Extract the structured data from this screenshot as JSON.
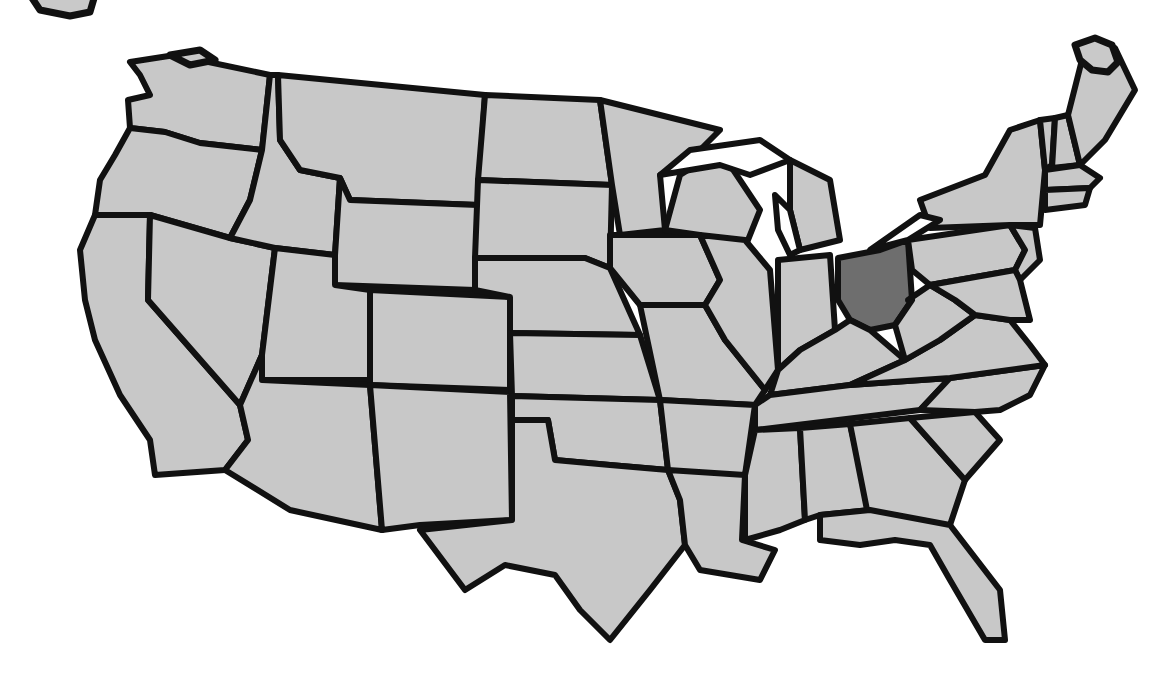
{
  "map": {
    "type": "us-states-outline",
    "colors": {
      "background": "#ffffff",
      "state_fill": "#c8c8c8",
      "highlight_fill": "#6e6e6e",
      "border": "#111111"
    },
    "highlighted_states": [
      "Ohio"
    ],
    "states": [
      {
        "name": "Washington",
        "points": "130,62 175,55 270,75 262,150 200,143 165,132 130,128 128,100 150,95 140,75"
      },
      {
        "name": "Oregon",
        "points": "130,128 165,132 200,143 262,150 250,200 230,238 150,215 95,215 100,180 115,155"
      },
      {
        "name": "California",
        "points": "95,215 150,215 148,300 240,405 248,440 225,470 155,475 150,440 120,395 95,340 85,300 80,250"
      },
      {
        "name": "Nevada",
        "points": "150,215 230,238 275,248 262,355 240,405 148,300"
      },
      {
        "name": "Idaho",
        "points": "270,75 278,75 280,140 300,170 340,178 335,255 275,248 230,238 250,200 262,150"
      },
      {
        "name": "Montana",
        "points": "278,75 485,95 478,205 350,200 340,178 300,170 280,140"
      },
      {
        "name": "Wyoming",
        "points": "350,200 478,205 475,290 335,285 335,255 340,178"
      },
      {
        "name": "Utah",
        "points": "275,248 335,255 335,285 370,290 370,380 262,380 262,355"
      },
      {
        "name": "Arizona",
        "points": "262,380 370,385 382,530 290,510 225,470 248,440 240,405 262,355"
      },
      {
        "name": "Colorado",
        "points": "370,290 510,297 510,390 370,385"
      },
      {
        "name": "New Mexico",
        "points": "370,385 510,392 512,520 420,525 382,530"
      },
      {
        "name": "North Dakota",
        "points": "485,95 600,100 612,185 478,180"
      },
      {
        "name": "South Dakota",
        "points": "478,180 612,185 610,268 585,258 475,258"
      },
      {
        "name": "Nebraska",
        "points": "475,258 585,258 610,268 640,335 510,333 510,297 475,290"
      },
      {
        "name": "Kansas",
        "points": "510,333 640,335 660,400 512,396"
      },
      {
        "name": "Oklahoma",
        "points": "512,396 660,400 668,470 610,465 555,460 548,420 512,420"
      },
      {
        "name": "Texas",
        "points": "512,420 548,420 555,460 610,465 668,470 680,500 685,545 650,590 610,640 580,610 555,575 505,565 465,590 420,530 512,520"
      },
      {
        "name": "Minnesota",
        "points": "600,100 720,130 690,160 660,175 665,230 620,235 612,185"
      },
      {
        "name": "Iowa",
        "points": "610,235 700,235 720,280 705,305 640,305 610,268"
      },
      {
        "name": "Missouri",
        "points": "640,305 705,305 725,340 765,390 755,405 660,400"
      },
      {
        "name": "Arkansas",
        "points": "660,400 755,405 745,475 685,480 668,470"
      },
      {
        "name": "Louisiana",
        "points": "668,470 745,475 742,540 775,550 760,580 700,570 685,545 680,500"
      },
      {
        "name": "Wisconsin",
        "points": "680,175 720,150 760,210 740,260 700,235 665,230"
      },
      {
        "name": "Illinois",
        "points": "700,235 745,240 770,270 778,370 765,390 725,340 705,305 720,280"
      },
      {
        "name": "Michigan",
        "points": "790,160 830,180 840,240 800,250 790,210"
      },
      {
        "name": "Indiana",
        "points": "778,260 830,255 835,330 800,350 778,370"
      },
      {
        "name": "Ohio",
        "points": "838,258 880,250 908,240 912,300 895,325 870,330 850,320 838,300"
      },
      {
        "name": "Kentucky",
        "points": "778,370 800,350 835,330 850,320 870,330 905,360 850,385 770,395"
      },
      {
        "name": "Tennessee",
        "points": "755,405 770,395 850,385 950,378 920,410 755,430"
      },
      {
        "name": "Mississippi",
        "points": "755,430 800,428 805,520 780,530 745,540 745,475"
      },
      {
        "name": "Alabama",
        "points": "800,428 850,424 870,510 820,515 805,520"
      },
      {
        "name": "Georgia",
        "points": "850,424 910,418 965,480 950,525 870,525"
      },
      {
        "name": "Florida",
        "points": "820,515 870,510 950,525 1000,590 1005,640 985,640 950,580 930,545 895,540 860,545 820,540"
      },
      {
        "name": "South Carolina",
        "points": "910,418 975,412 1000,440 965,480"
      },
      {
        "name": "North Carolina",
        "points": "920,410 950,378 1045,365 1030,395 1000,410 975,412"
      },
      {
        "name": "Virginia",
        "points": "905,360 940,340 975,315 1010,320 1030,345 1045,365 950,378 850,385"
      },
      {
        "name": "West Virginia",
        "points": "908,300 930,285 955,300 975,315 940,340 905,360 895,325 912,300"
      },
      {
        "name": "Pennsylvania",
        "points": "908,240 1010,225 1025,250 1015,270 930,285 912,270"
      },
      {
        "name": "New York",
        "points": "920,200 985,175 1010,130 1040,120 1045,170 1040,225 1010,225 930,228"
      },
      {
        "name": "New Jersey",
        "points": "1010,225 1035,228 1040,260 1020,280 1015,270 1025,250"
      },
      {
        "name": "Maryland-Delaware",
        "points": "930,285 1015,270 1020,280 1030,320 1010,320 975,315 955,300"
      },
      {
        "name": "Vermont",
        "points": "1040,120 1055,118 1052,165 1045,170"
      },
      {
        "name": "New Hampshire",
        "points": "1055,118 1068,115 1080,165 1052,168"
      },
      {
        "name": "Maine",
        "points": "1068,115 1085,48 1115,48 1135,90 1105,140 1080,165"
      },
      {
        "name": "Massachusetts",
        "points": "1045,170 1080,165 1100,178 1090,188 1045,190"
      },
      {
        "name": "Connecticut-Rhode Island",
        "points": "1045,190 1090,188 1085,205 1045,210"
      }
    ],
    "lakes": [
      {
        "name": "Lake Superior",
        "points": "660,175 690,150 760,140 790,160 750,175 720,165"
      },
      {
        "name": "Lake Michigan",
        "points": "775,195 790,210 800,250 790,255 778,230"
      },
      {
        "name": "Lake Erie",
        "points": "870,250 920,215 940,220 908,240"
      }
    ],
    "top_fragments": [
      {
        "name": "fragment-left",
        "points": "30,-5 95,-5 90,12 70,16 40,10"
      },
      {
        "name": "fragment-mid",
        "points": "170,55 200,50 215,60 190,65"
      },
      {
        "name": "fragment-right",
        "points": "1075,45 1095,38 1112,45 1118,62 1108,72 1092,70 1080,60"
      }
    ]
  }
}
